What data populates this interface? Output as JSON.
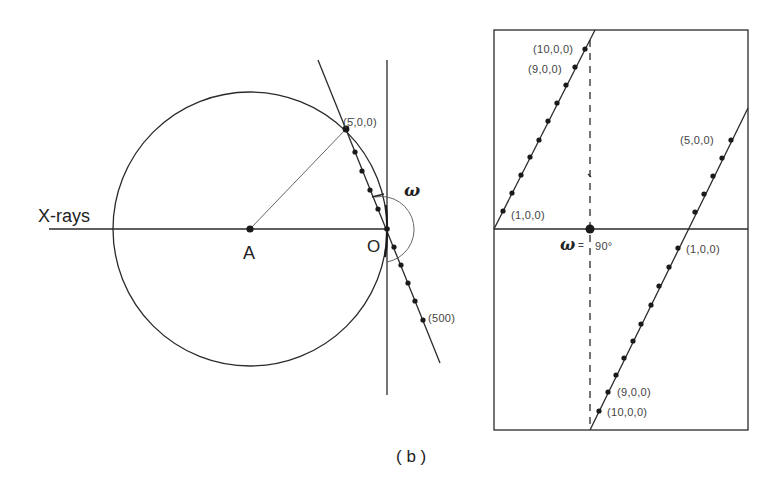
{
  "left_panel": {
    "incident_beam_label": "X-rays",
    "center_label": "A",
    "origin_label": "O",
    "angle_label": "ω",
    "point_top_label": "(5̄,0,0)",
    "point_bottom_label": "(500)"
  },
  "right_panel": {
    "upper_left_line": {
      "top_label": "(10,0,0)",
      "second_label": "(9,0,0)",
      "bottom_label": "(1,0,0)"
    },
    "right_line": {
      "top_label": "(5,0,0)",
      "axis_label": "(1,0,0)",
      "second_last_label": "(9,0,0)",
      "last_label": "(10,0,0)"
    },
    "omega_symbol": "ω",
    "omega_equals": "=",
    "omega_value": "90°"
  },
  "caption": "( b )",
  "geometry": {
    "circle": {
      "cx": 250,
      "cy": 229,
      "r": 137
    },
    "origin_O": [
      387,
      229
    ],
    "slanted_line": {
      "from": [
        318,
        60
      ],
      "to": [
        440,
        363
      ]
    },
    "left_dots": [
      [
        346,
        129
      ],
      [
        355,
        152
      ],
      [
        362,
        171
      ],
      [
        370,
        190
      ],
      [
        378,
        209
      ],
      [
        387,
        229
      ],
      [
        394,
        247
      ],
      [
        401,
        265
      ],
      [
        408,
        283
      ],
      [
        415,
        301
      ],
      [
        423,
        320
      ]
    ],
    "right_box": {
      "x": 494,
      "y": 30,
      "w": 254,
      "h": 400
    },
    "right_axis_y": 229,
    "dashed_x": 590,
    "upper_left_dots": [
      [
        503,
        211
      ],
      [
        512,
        193
      ],
      [
        521,
        175
      ],
      [
        530,
        157
      ],
      [
        539,
        140
      ],
      [
        548,
        121
      ],
      [
        557,
        103
      ],
      [
        566,
        85
      ],
      [
        575,
        68
      ],
      [
        585,
        49
      ]
    ],
    "right_line_upper_dots": [
      [
        695,
        212
      ],
      [
        703,
        194
      ],
      [
        713,
        176
      ],
      [
        722,
        158
      ],
      [
        731,
        140
      ]
    ],
    "right_line_lower_dots": [
      [
        678,
        248
      ],
      [
        668,
        268
      ],
      [
        659,
        287
      ],
      [
        650,
        305
      ],
      [
        641,
        324
      ],
      [
        633,
        341
      ],
      [
        624,
        358
      ],
      [
        616,
        375
      ],
      [
        608,
        392
      ],
      [
        599,
        411
      ]
    ]
  }
}
